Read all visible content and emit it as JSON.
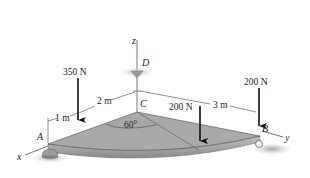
{
  "figure": {
    "type": "3D statics diagram"
  },
  "axes": {
    "x_label": "x",
    "y_label": "y",
    "z_label": "z"
  },
  "points": {
    "A": "A",
    "B": "B",
    "C": "C",
    "D": "D"
  },
  "forces": [
    {
      "id": "force-350",
      "label": "350 N",
      "magnitude": 350,
      "unit": "N",
      "direction": "down"
    },
    {
      "id": "force-200-mid",
      "label": "200 N",
      "magnitude": 200,
      "unit": "N",
      "direction": "down"
    },
    {
      "id": "force-200-B",
      "label": "200 N",
      "magnitude": 200,
      "unit": "N",
      "direction": "down"
    }
  ],
  "dimensions": {
    "d_1m": "1 m",
    "d_2m": "2 m",
    "d_3m": "3 m",
    "angle": "60°"
  },
  "colors": {
    "plate_top": "#a9a9a9",
    "plate_edge": "#8c8c8c",
    "force_arrow": "#111111",
    "support": "#9a9a9a"
  }
}
